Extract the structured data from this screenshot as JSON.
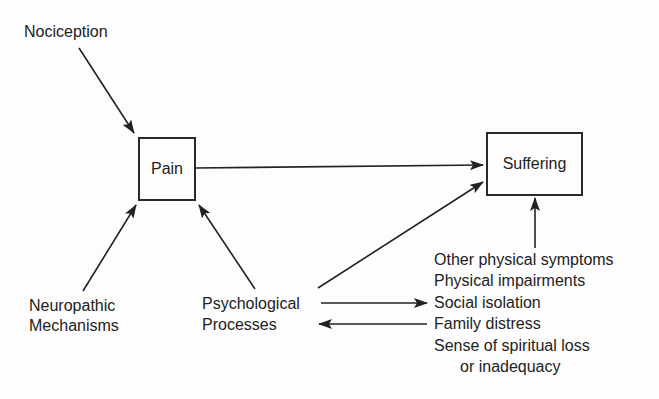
{
  "diagram": {
    "type": "flow",
    "nodes": {
      "nociception": {
        "label": "Nociception"
      },
      "pain": {
        "label": "Pain"
      },
      "suffering": {
        "label": "Suffering"
      },
      "neuropathic": {
        "line1": "Neuropathic",
        "line2": "Mechanisms"
      },
      "psychological": {
        "line1": "Psychological",
        "line2": "Processes"
      }
    },
    "factors": [
      "Other physical symptoms",
      "Physical impairments",
      "Social isolation",
      "Family distress",
      "Sense of spiritual loss",
      "or inadequacy"
    ],
    "edges": [
      {
        "from": "Nociception",
        "to": "Pain"
      },
      {
        "from": "Neuropathic Mechanisms",
        "to": "Pain"
      },
      {
        "from": "Psychological Processes",
        "to": "Pain"
      },
      {
        "from": "Pain",
        "to": "Suffering"
      },
      {
        "from": "Psychological Processes",
        "to": "Suffering"
      },
      {
        "from": "Factors list",
        "to": "Suffering"
      },
      {
        "from": "Psychological Processes",
        "to": "Social isolation"
      },
      {
        "from": "Family distress",
        "to": "Psychological Processes"
      }
    ],
    "colors": {
      "ink": "#222222",
      "background": "#fdfdfd"
    }
  }
}
